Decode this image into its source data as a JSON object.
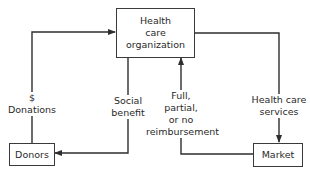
{
  "nodes": {
    "organization": {
      "lines": [
        "Health",
        "care",
        "organization"
      ]
    },
    "donors": {
      "label": "Donors"
    },
    "market": {
      "label": "Market"
    }
  },
  "edges": {
    "donations": {
      "lines": [
        "$",
        "Donations"
      ],
      "from": "donors",
      "to": "organization"
    },
    "social_benefit": {
      "lines": [
        "Social",
        "benefit"
      ],
      "from": "organization",
      "to": "donors"
    },
    "reimbursement": {
      "lines": [
        "Full,",
        "partial,",
        "or no",
        "reimbursement"
      ],
      "from": "market",
      "to": "organization"
    },
    "services": {
      "lines": [
        "Health care",
        "services"
      ],
      "from": "organization",
      "to": "market"
    }
  },
  "colors": {
    "line": "#2e2e2e",
    "background": "#ffffff"
  }
}
